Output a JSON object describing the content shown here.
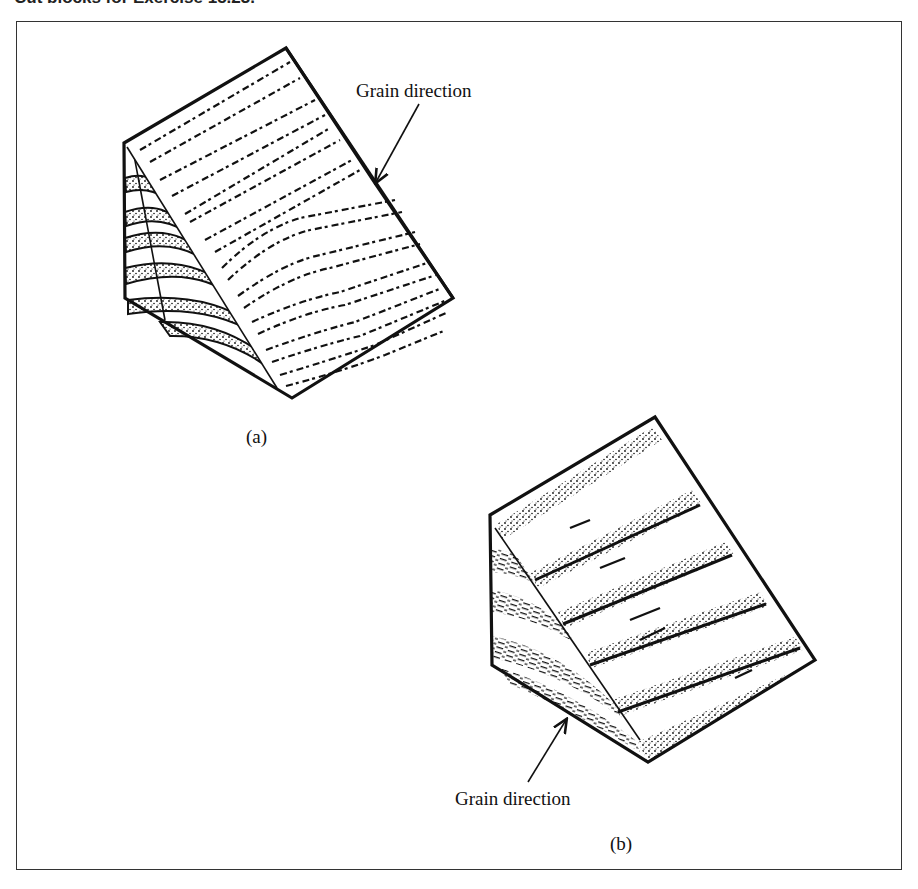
{
  "caption": {
    "text": "Cut blocks for Exercise 15.23."
  },
  "figure": {
    "panel_a": {
      "label": "(a)",
      "annotation": "Grain direction"
    },
    "panel_b": {
      "label": "(b)",
      "annotation": "Grain direction"
    }
  },
  "colors": {
    "ink": "#111111",
    "background": "#ffffff",
    "frame": "#333333"
  }
}
